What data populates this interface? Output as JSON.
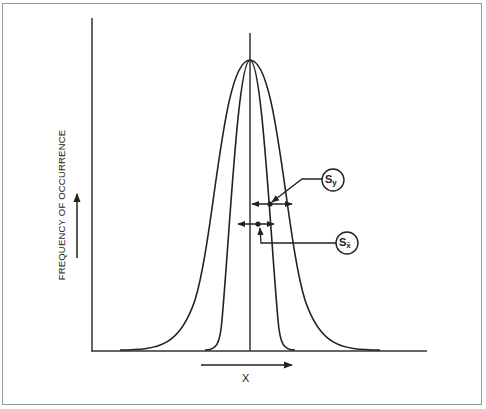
{
  "figure": {
    "type": "normal distribution comparison diagram",
    "y_axis_label": "FREQUENCY OF OCCURRENCE",
    "x_axis_label": "X",
    "curves": [
      {
        "name": "population distribution",
        "width": "wide",
        "spread_label": "Sy"
      },
      {
        "name": "distribution of sample means",
        "width": "narrow",
        "spread_label": "Sx̄"
      }
    ],
    "callouts": [
      {
        "symbol": "S",
        "subscript": "y",
        "points_to": "wide curve spread arrow"
      },
      {
        "symbol": "S",
        "subscript": "x̄",
        "points_to": "narrow curve spread arrow"
      }
    ],
    "colors": {
      "line": "#222222",
      "frame": "#9a9a9a",
      "background": "#ffffff"
    }
  }
}
